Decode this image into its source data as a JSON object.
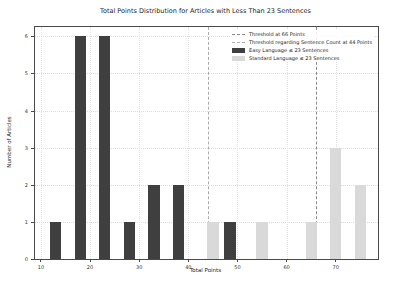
{
  "chart_data": {
    "type": "bar",
    "title": "Total Points Distribution for Articles with Less Than 23 Sentences",
    "xlabel": "Total Points",
    "ylabel": "Number of Articles",
    "xlim": [
      8.8,
      78.6
    ],
    "ylim": [
      0,
      6.25
    ],
    "x_ticks": [
      10,
      20,
      30,
      40,
      50,
      60,
      70
    ],
    "y_ticks": [
      0,
      1,
      2,
      3,
      4,
      5,
      6
    ],
    "grid": true,
    "legend_position": "upper-right",
    "bar_width_points": 2.3,
    "series": [
      {
        "name": "Easy Language ≤ 23 Sentences",
        "color": "#3f3f3f",
        "bars": [
          {
            "x": 13,
            "count": 1
          },
          {
            "x": 18,
            "count": 6
          },
          {
            "x": 23,
            "count": 6
          },
          {
            "x": 28,
            "count": 1
          },
          {
            "x": 33,
            "count": 2
          },
          {
            "x": 38,
            "count": 2
          },
          {
            "x": 48.5,
            "count": 1
          }
        ]
      },
      {
        "name": "Standard Language ≤ 23 Sentences",
        "color": "#d9d9d9",
        "bars": [
          {
            "x": 45,
            "count": 1
          },
          {
            "x": 55,
            "count": 1
          },
          {
            "x": 65,
            "count": 1
          },
          {
            "x": 70,
            "count": 3
          },
          {
            "x": 75,
            "count": 2
          }
        ]
      }
    ],
    "thresholds": [
      {
        "label": "Threshold at 66 Points",
        "x": 66,
        "color": "#8a8a8a",
        "style": "dashed"
      },
      {
        "label": "Threshold regarding Sentence Count at 44 Points",
        "x": 44,
        "color": "#ababab",
        "style": "dashed"
      }
    ],
    "colors": {
      "easy_bar": "#3f3f3f",
      "standard_bar": "#d9d9d9",
      "grid": "#dcdcdc",
      "spine": "#4a4a4a",
      "text": "#262626"
    }
  }
}
